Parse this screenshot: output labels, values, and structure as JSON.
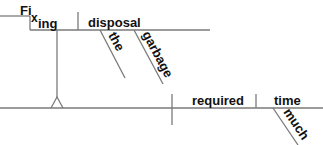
{
  "diagram": {
    "type": "sentence-diagram",
    "sentence_parts": {
      "gerund_phrase": {
        "word_stem": "Fi",
        "word_mid": "x",
        "word_suffix": "ing",
        "object": "disposal",
        "modifiers": [
          "the",
          "garbage"
        ]
      },
      "main_clause": {
        "verb": "required",
        "direct_object": "time",
        "object_modifiers": [
          "much"
        ]
      }
    },
    "colors": {
      "line": "#7a7a7a",
      "text": "#111111",
      "background": "#ffffff"
    }
  }
}
